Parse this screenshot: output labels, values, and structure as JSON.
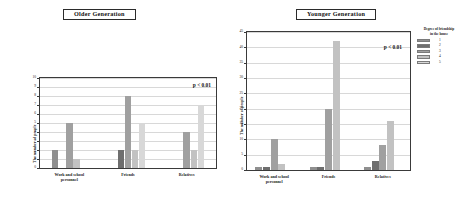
{
  "figure": {
    "p_value_text": "p < 0.01"
  },
  "legend": {
    "title": "Degree of friendship\nin the house",
    "entries": [
      {
        "label": "1",
        "color": "#8f8f8f"
      },
      {
        "label": "2",
        "color": "#6e6e6e"
      },
      {
        "label": "3",
        "color": "#a0a0a0"
      },
      {
        "label": "4",
        "color": "#c2c2c2"
      },
      {
        "label": "5",
        "color": "#d8d8d8"
      }
    ]
  },
  "panels": [
    {
      "key": "older",
      "title": "Older Generation",
      "ylabel": "The number of people",
      "p_value": "p < 0.01",
      "yticks": [
        "0",
        "1",
        "2",
        "3",
        "4",
        "5",
        "6",
        "7",
        "8",
        "9",
        "10"
      ],
      "categories": [
        "Work and school\npersonnel",
        "Friends",
        "Relatives"
      ]
    },
    {
      "key": "younger",
      "title": "Younger Generation",
      "ylabel": "The number of people",
      "p_value": "p < 0.01",
      "yticks": [
        "0",
        "5",
        "10",
        "15",
        "20",
        "25",
        "30",
        "35",
        "40",
        "45"
      ],
      "categories": [
        "Work and school\npersonnel",
        "Friends",
        "Relatives"
      ]
    }
  ],
  "chart_data": [
    {
      "type": "bar",
      "title": "Older Generation",
      "xlabel": "",
      "ylabel": "The number of people",
      "ylim": [
        0,
        10
      ],
      "ytick_step": 1,
      "grid": true,
      "legend_position": "right-outside",
      "annotations": [
        "p < 0.01"
      ],
      "categories": [
        "Work and school personnel",
        "Friends",
        "Relatives"
      ],
      "series": [
        {
          "name": "1",
          "values": [
            2,
            0,
            0
          ]
        },
        {
          "name": "2",
          "values": [
            0,
            2,
            0
          ]
        },
        {
          "name": "3",
          "values": [
            5,
            8,
            4
          ]
        },
        {
          "name": "4",
          "values": [
            1,
            2,
            2
          ]
        },
        {
          "name": "5",
          "values": [
            0,
            5,
            7
          ]
        }
      ]
    },
    {
      "type": "bar",
      "title": "Younger Generation",
      "xlabel": "",
      "ylabel": "The number of people",
      "ylim": [
        0,
        45
      ],
      "ytick_step": 5,
      "grid": true,
      "legend_position": "right-outside",
      "annotations": [
        "p < 0.01"
      ],
      "categories": [
        "Work and school personnel",
        "Friends",
        "Relatives"
      ],
      "series": [
        {
          "name": "1",
          "values": [
            1,
            1,
            1
          ]
        },
        {
          "name": "2",
          "values": [
            1,
            1,
            3
          ]
        },
        {
          "name": "3",
          "values": [
            10,
            20,
            8
          ]
        },
        {
          "name": "4",
          "values": [
            2,
            42,
            16
          ]
        },
        {
          "name": "5",
          "values": [
            0,
            0,
            0
          ]
        }
      ]
    }
  ]
}
